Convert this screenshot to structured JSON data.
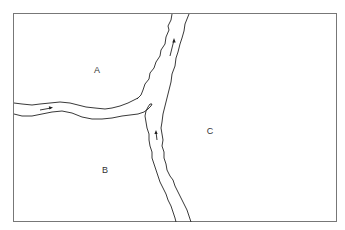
{
  "diagram": {
    "type": "river-confluence-map",
    "regions": [
      {
        "id": "A",
        "label": "A",
        "x": 97,
        "y": 70
      },
      {
        "id": "B",
        "label": "B",
        "x": 105,
        "y": 170
      },
      {
        "id": "C",
        "label": "C",
        "x": 210,
        "y": 131
      }
    ],
    "rivers": [
      {
        "name": "left-tributary",
        "flow_direction": "east"
      },
      {
        "name": "lower-tributary",
        "flow_direction": "north"
      },
      {
        "name": "main-stem",
        "flow_direction": "north"
      }
    ],
    "colors": {
      "line": "#222222",
      "border": "#777777",
      "background": "#ffffff",
      "text": "#333333"
    }
  }
}
